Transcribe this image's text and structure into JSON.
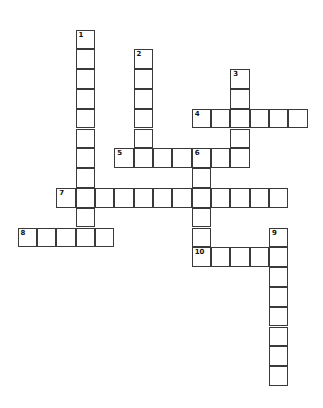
{
  "puzzle": {
    "origin": {
      "x": 18,
      "y": 30
    },
    "cell": {
      "w": 19.35,
      "h": 19.8
    },
    "words": [
      {
        "number": "1",
        "dir": "down",
        "col": 3,
        "row": 0,
        "len": 11
      },
      {
        "number": "2",
        "dir": "down",
        "col": 6,
        "row": 1,
        "len": 6
      },
      {
        "number": "3",
        "dir": "down",
        "col": 11,
        "row": 2,
        "len": 5
      },
      {
        "number": "4",
        "dir": "across",
        "col": 9,
        "row": 4,
        "len": 6
      },
      {
        "number": "5",
        "dir": "across",
        "col": 5,
        "row": 6,
        "len": 7
      },
      {
        "number": "6",
        "dir": "down",
        "col": 9,
        "row": 6,
        "len": 6
      },
      {
        "number": "7",
        "dir": "across",
        "col": 2,
        "row": 8,
        "len": 12
      },
      {
        "number": "8",
        "dir": "across",
        "col": 0,
        "row": 10,
        "len": 5
      },
      {
        "number": "9",
        "dir": "down",
        "col": 13,
        "row": 10,
        "len": 8
      },
      {
        "number": "10",
        "dir": "across",
        "col": 9,
        "row": 11,
        "len": 5
      }
    ]
  }
}
